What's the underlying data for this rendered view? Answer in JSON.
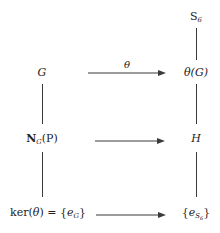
{
  "diagram": {
    "type": "commutative-diagram",
    "background_color": "#ffffff",
    "line_color": "#3a3a3a",
    "text_color": "#222222",
    "nodes": {
      "top_right": "S6",
      "row1_left": "G",
      "row1_right": "theta(G)",
      "row2_left": "NG(P)",
      "row2_right": "H",
      "row3_left": "ker(theta) = {eG}",
      "row3_right": "{eS6}"
    },
    "arrow_labels": {
      "top": "theta",
      "middle": "",
      "bottom": ""
    }
  }
}
